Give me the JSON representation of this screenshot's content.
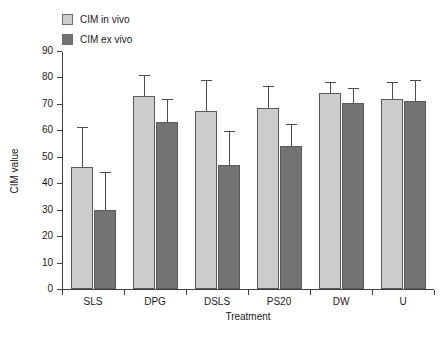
{
  "chart_data": {
    "type": "bar",
    "title": "",
    "xlabel": "Treatment",
    "ylabel": "CIM value",
    "ylim": [
      0,
      90
    ],
    "yticks": [
      0,
      10,
      20,
      30,
      40,
      50,
      60,
      70,
      80,
      90
    ],
    "grid": false,
    "legend_position": "top-left",
    "categories": [
      "SLS",
      "DPG",
      "DSLS",
      "PS20",
      "DW",
      "U"
    ],
    "series": [
      {
        "name": "CIM in vivo",
        "color": "#cccccc",
        "values": [
          46,
          73,
          67.5,
          68.5,
          74,
          72
        ],
        "errors_upper": [
          61,
          80.5,
          78.5,
          76.5,
          78,
          78
        ]
      },
      {
        "name": "CIM ex vivo",
        "color": "#737373",
        "values": [
          30,
          63,
          47,
          54,
          70.5,
          71
        ],
        "errors_upper": [
          44,
          71.5,
          59.5,
          62,
          75.5,
          78.5
        ]
      }
    ]
  },
  "legend": {
    "items": [
      {
        "label": "CIM in vivo",
        "color": "#cccccc"
      },
      {
        "label": "CIM ex vivo",
        "color": "#737373"
      }
    ]
  },
  "axes": {
    "y_title": "CIM value",
    "x_title": "Treatment",
    "y_tick_labels": [
      "90",
      "80",
      "70",
      "60",
      "50",
      "40",
      "30",
      "20",
      "10",
      "0"
    ],
    "x_tick_labels": [
      "SLS",
      "DPG",
      "DSLS",
      "PS20",
      "DW",
      "U"
    ]
  }
}
